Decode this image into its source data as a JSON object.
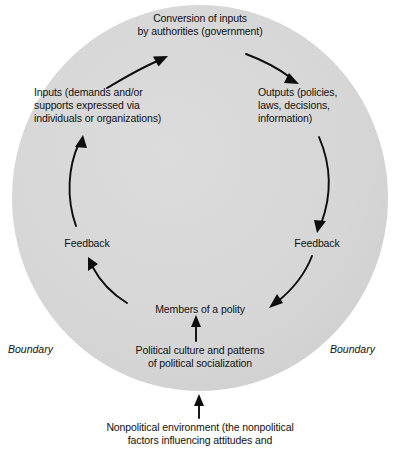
{
  "diagram": {
    "circle": {
      "name": "political-system-boundary-circle",
      "fill": "#d7d7d7",
      "cx": 200,
      "cy": 198,
      "rx": 188,
      "ry": 193
    },
    "nodes": {
      "conversion": "Conversion of inputs\nby authorities (government)",
      "inputs": "Inputs (demands and/or\nsupports expressed via\nindividuals or organizations)",
      "outputs": "Outputs (policies,\nlaws, decisions,\ninformation)",
      "feedback_left": "Feedback",
      "feedback_right": "Feedback",
      "members": "Members of a polity",
      "political_culture": "Political culture and patterns\nof political socialization",
      "nonpolitical_environment": "Nonpolitical environment (the nonpolitical\nfactors influencing attitudes and"
    },
    "boundary_left": "Boundary",
    "boundary_right": "Boundary",
    "arrows": [
      {
        "name": "arrow-inputs-to-conversion",
        "from": "inputs",
        "to": "conversion"
      },
      {
        "name": "arrow-conversion-to-outputs",
        "from": "conversion",
        "to": "outputs"
      },
      {
        "name": "arrow-outputs-to-feedback-right",
        "from": "outputs",
        "to": "feedback_right"
      },
      {
        "name": "arrow-feedback-right-to-members",
        "from": "feedback_right",
        "to": "members"
      },
      {
        "name": "arrow-members-to-feedback-left",
        "from": "members",
        "to": "feedback_left"
      },
      {
        "name": "arrow-feedback-left-to-inputs",
        "from": "feedback_left",
        "to": "inputs"
      },
      {
        "name": "arrow-culture-to-members",
        "from": "political_culture",
        "to": "members"
      },
      {
        "name": "arrow-nonpolitical-to-culture",
        "from": "nonpolitical_environment",
        "to": "political_culture"
      }
    ]
  }
}
